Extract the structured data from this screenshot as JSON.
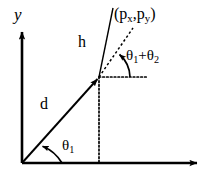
{
  "figure": {
    "type": "geometry-diagram",
    "background_color": "#ffffff",
    "stroke_color": "#000000"
  },
  "axes": {
    "y_axis_label": "y",
    "x_axis_label": "",
    "origin_label": ""
  },
  "labels": {
    "vector_d": "d",
    "segment_h": "h",
    "point_coordinates": {
      "open_paren": "(",
      "p_base_x": "p",
      "p_sub_x": "x",
      "comma": ",",
      "p_base_y": "p",
      "p_sub_y": "y",
      "close_paren": ")"
    },
    "angle_theta1": {
      "base": "θ",
      "sub": "1"
    },
    "angle_sum": {
      "theta_base": "θ",
      "theta_sub": "1",
      "plus": "+",
      "theta2_base": "θ",
      "theta2_sub": "2"
    }
  },
  "geometry": {
    "origin": {
      "x": 22,
      "y": 163
    },
    "point_p": {
      "x": 99,
      "y": 77
    },
    "y_axis_tip": {
      "x": 22,
      "y": 30
    },
    "x_axis_tip": {
      "x": 200,
      "y": 163
    },
    "h_line_end": {
      "x": 113,
      "y": 8
    },
    "dashed_ray_end": {
      "x": 133,
      "y": 28
    },
    "horizontal_dotted_end": {
      "x": 148,
      "y": 77
    },
    "vertical_dotted_end": {
      "x": 99,
      "y": 163
    }
  }
}
